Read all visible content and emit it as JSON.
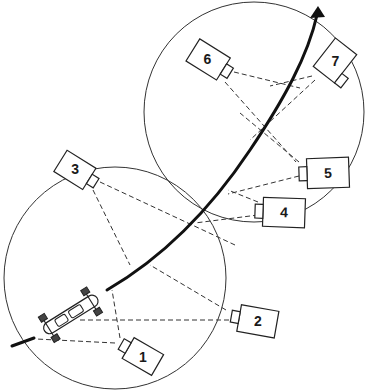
{
  "diagram": {
    "colors": {
      "line": "#222222",
      "background": "#ffffff"
    },
    "cameras": [
      {
        "id": "1",
        "label": "1"
      },
      {
        "id": "2",
        "label": "2"
      },
      {
        "id": "3",
        "label": "3"
      },
      {
        "id": "4",
        "label": "4"
      },
      {
        "id": "5",
        "label": "5"
      },
      {
        "id": "6",
        "label": "6"
      },
      {
        "id": "7",
        "label": "7"
      }
    ],
    "zones": [
      {
        "name": "lower-coverage-circle"
      },
      {
        "name": "upper-coverage-circle"
      }
    ],
    "path": {
      "name": "race-car-trajectory",
      "arrow": "direction-of-travel"
    },
    "vehicle": {
      "name": "race-car"
    }
  }
}
